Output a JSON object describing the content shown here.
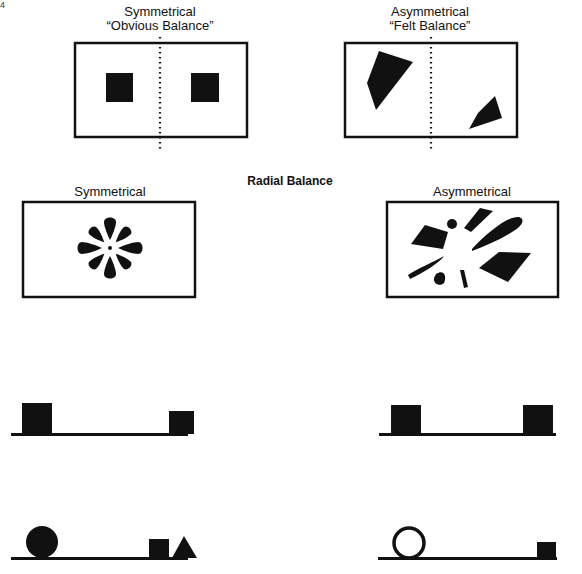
{
  "page_mark": "4",
  "top": {
    "left": {
      "title": "Symmetrical",
      "subtitle": "“Obvious Balance”"
    },
    "right": {
      "title": "Asymmetrical",
      "subtitle": "“Felt Balance”"
    }
  },
  "radial": {
    "heading": "Radial Balance",
    "left": {
      "title": "Symmetrical"
    },
    "right": {
      "title": "Asymmetrical"
    }
  },
  "colors": {
    "ink": "#111111",
    "background": "#ffffff"
  }
}
